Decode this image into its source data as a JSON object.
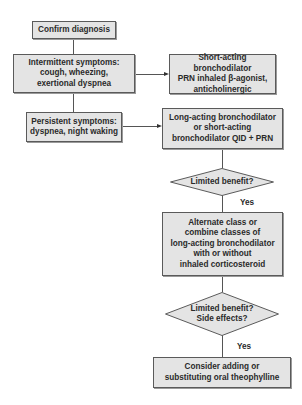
{
  "flowchart": {
    "nodes": {
      "confirm": {
        "text": "Confirm diagnosis",
        "shape": "rect"
      },
      "intermittent": {
        "text": "Intermittent symptoms:\ncough, wheezing,\nexertional dyspnea",
        "shape": "rect"
      },
      "short_acting": {
        "text": "Short-acting bronchodilator\nPRN inhaled β-agonist,\nanticholinergic",
        "shape": "rect"
      },
      "persistent": {
        "text": "Persistent symptoms:\ndyspnea, night waking",
        "shape": "rect"
      },
      "long_acting": {
        "text": "Long-acting bronchodilator\nor short-acting\nbronchodilator QID + PRN",
        "shape": "rect"
      },
      "decision1": {
        "text": "Limited benefit?",
        "shape": "diamond"
      },
      "alternate": {
        "text": "Alternate class or\ncombine classes of\nlong-acting bronchodilator\nwith or without\ninhaled corticosteroid",
        "shape": "rect"
      },
      "decision2": {
        "text": "Limited benefit?\nSide effects?",
        "shape": "diamond"
      },
      "theophylline": {
        "text": "Consider adding or\nsubstituting oral theophylline",
        "shape": "rect"
      }
    },
    "edge_labels": {
      "yes1": "Yes",
      "yes2": "Yes"
    },
    "colors": {
      "box_fill": "#e4e4e4",
      "box_border": "#5a5a5a",
      "line": "#555555",
      "text": "#2a2a2a"
    }
  }
}
